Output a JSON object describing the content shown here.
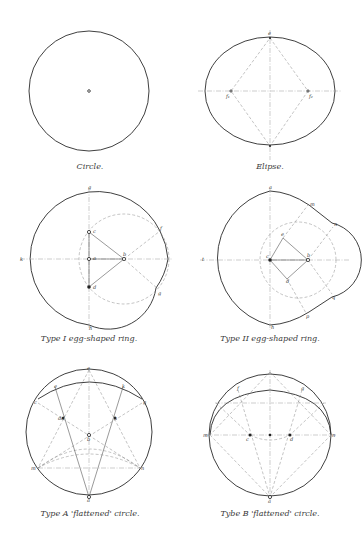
{
  "figures": [
    {
      "id": "circle",
      "caption": "Circle.",
      "labels": []
    },
    {
      "id": "ellipse",
      "caption": "Elipse.",
      "labels": [
        "e",
        "f1",
        "f2"
      ]
    },
    {
      "id": "type-1-egg",
      "caption": "Type I egg-shaped ring.",
      "labels": [
        "g",
        "c",
        "a",
        "b",
        "d",
        "f",
        "g",
        "h",
        "k"
      ]
    },
    {
      "id": "type-2-egg",
      "caption": "Type II egg-shaped ring.",
      "labels": [
        "a",
        "m",
        "n",
        "e",
        "b",
        "c",
        "d",
        "q",
        "p",
        "h",
        "t"
      ]
    },
    {
      "id": "type-a-flattened",
      "caption": "Type A 'flattened' circle.",
      "labels": [
        "e",
        "k",
        "c",
        "g",
        "dd",
        "h",
        "b",
        "m",
        "n",
        "a"
      ]
    },
    {
      "id": "type-b-flattened",
      "caption": "Tybe B 'flattened' circle.",
      "labels": [
        "f",
        "g",
        "m",
        "c",
        "d",
        "n",
        "a"
      ]
    }
  ],
  "colors": {
    "ink": "#2a2a2a",
    "construction": "#888888",
    "background": "#ffffff"
  }
}
